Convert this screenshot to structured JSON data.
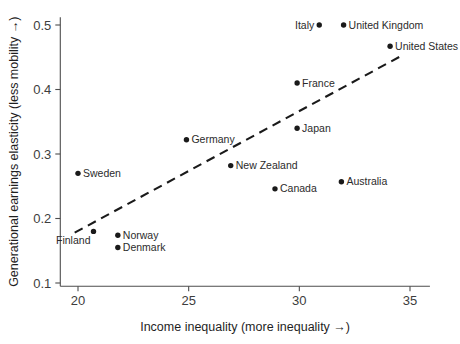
{
  "chart_data": {
    "type": "scatter",
    "title": "",
    "xlabel": "Income inequality (more inequality →)",
    "ylabel": "Generational earnings elasticity (less mobility →)",
    "xlim": [
      19.2,
      35.9
    ],
    "ylim": [
      0.095,
      0.512
    ],
    "xticks": [
      20,
      25,
      30,
      35
    ],
    "xtick_labels": [
      "20",
      "25",
      "30",
      "35"
    ],
    "yticks": [
      0.1,
      0.2,
      0.3,
      0.4,
      0.5
    ],
    "ytick_labels": [
      "0.1",
      "0.2",
      "0.3",
      "0.4",
      "0.5"
    ],
    "grid": false,
    "legend": "none",
    "point_color": "#1a1a1a",
    "line_color": "#1a1a1a",
    "axis_color": "#4d4d4d",
    "points": [
      {
        "label": "Sweden",
        "x": 20.0,
        "y": 0.27,
        "label_side": "right"
      },
      {
        "label": "Finland",
        "x": 20.7,
        "y": 0.18,
        "label_side": "below"
      },
      {
        "label": "Norway",
        "x": 21.8,
        "y": 0.174,
        "label_side": "right"
      },
      {
        "label": "Denmark",
        "x": 21.8,
        "y": 0.155,
        "label_side": "right"
      },
      {
        "label": "Germany",
        "x": 24.9,
        "y": 0.322,
        "label_side": "right"
      },
      {
        "label": "New Zealand",
        "x": 26.9,
        "y": 0.282,
        "label_side": "right"
      },
      {
        "label": "Canada",
        "x": 28.9,
        "y": 0.246,
        "label_side": "right"
      },
      {
        "label": "France",
        "x": 29.9,
        "y": 0.41,
        "label_side": "right"
      },
      {
        "label": "Japan",
        "x": 29.9,
        "y": 0.34,
        "label_side": "right"
      },
      {
        "label": "Italy",
        "x": 30.9,
        "y": 0.5,
        "label_side": "left"
      },
      {
        "label": "Australia",
        "x": 31.9,
        "y": 0.257,
        "label_side": "right"
      },
      {
        "label": "United Kingdom",
        "x": 32.0,
        "y": 0.5,
        "label_side": "right"
      },
      {
        "label": "United States",
        "x": 34.1,
        "y": 0.467,
        "label_side": "right"
      }
    ],
    "trend_line": {
      "style": "dashed",
      "x_start": 19.85,
      "y_start": 0.178,
      "x_end": 34.6,
      "y_end": 0.452
    }
  }
}
